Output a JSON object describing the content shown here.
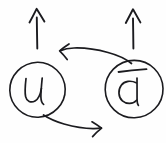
{
  "diagram": {
    "background_color": "#fefefe",
    "ink_color": "#1b1b1f",
    "nodes": [
      {
        "id": "node-u",
        "label": "u",
        "label_name": "up-quark",
        "has_overbar": false,
        "center_x": 37,
        "center_y": 90,
        "radius_x": 28,
        "radius_y": 28
      },
      {
        "id": "node-dbar",
        "label": "d",
        "label_name": "anti-down-quark",
        "has_overbar": true,
        "center_x": 134,
        "center_y": 89,
        "radius_x": 29,
        "radius_y": 29
      }
    ],
    "vertical_arrows": [
      {
        "id": "arrow-up-left",
        "direction": "up",
        "from_x": 37,
        "from_y": 48,
        "to_x": 37,
        "to_y": 9
      },
      {
        "id": "arrow-up-right",
        "direction": "up",
        "from_x": 133,
        "from_y": 48,
        "to_x": 133,
        "to_y": 9
      }
    ],
    "curved_arrows": [
      {
        "id": "curve-right-to-left",
        "direction": "left",
        "from_node": "node-dbar",
        "to_node": "node-u",
        "start_x": 130,
        "start_y": 62,
        "end_x": 60,
        "end_y": 51
      },
      {
        "id": "curve-left-to-right",
        "direction": "right",
        "from_node": "node-u",
        "to_node": "node-dbar",
        "start_x": 44,
        "start_y": 116,
        "end_x": 101,
        "end_y": 128
      }
    ]
  }
}
